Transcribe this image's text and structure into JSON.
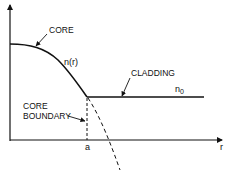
{
  "diagram": {
    "labels": {
      "core": "CORE",
      "n_r": "n(r)",
      "cladding": "CLADDING",
      "n0": "n",
      "n0_sub": "0",
      "core_boundary_line1": "CORE",
      "core_boundary_line2": "BOUNDARY",
      "a": "a",
      "r": "r"
    },
    "axes": {
      "x_label": "r",
      "x_tick": "a",
      "y_label": ""
    },
    "colors": {
      "line": "#111111",
      "background": "#ffffff"
    }
  }
}
